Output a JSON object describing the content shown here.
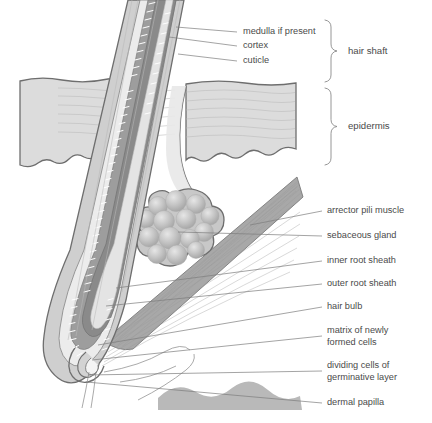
{
  "figure": {
    "background_color": "#ffffff",
    "text_color": "#4a4a4a",
    "leader_color": "#7d7d7d"
  },
  "labels": [
    {
      "id": "medulla",
      "text": "medulla if present",
      "x": 243,
      "y": 32,
      "leader_from_x": 237,
      "leader_from_y": 32,
      "leader_to_x": 176,
      "leader_to_y": 27
    },
    {
      "id": "cortex",
      "text": "cortex",
      "x": 243,
      "y": 46,
      "leader_from_x": 237,
      "leader_from_y": 46,
      "leader_to_x": 169,
      "leader_to_y": 37
    },
    {
      "id": "cuticle",
      "text": "cuticle",
      "x": 243,
      "y": 61,
      "leader_from_x": 237,
      "leader_from_y": 61,
      "leader_to_x": 178,
      "leader_to_y": 54
    },
    {
      "id": "arrector-pili",
      "text": "arrector pili muscle",
      "x": 327,
      "y": 211,
      "leader_from_x": 322,
      "leader_from_y": 211,
      "leader_to_x": 250,
      "leader_to_y": 225
    },
    {
      "id": "sebaceous-gland",
      "text": "sebaceous gland",
      "x": 327,
      "y": 236,
      "leader_from_x": 322,
      "leader_from_y": 236,
      "leader_to_x": 178,
      "leader_to_y": 232
    },
    {
      "id": "inner-root-sheath",
      "text": "inner root sheath",
      "x": 327,
      "y": 261,
      "leader_from_x": 322,
      "leader_from_y": 261,
      "leader_to_x": 116,
      "leader_to_y": 288
    },
    {
      "id": "outer-root-sheath",
      "text": "outer root sheath",
      "x": 327,
      "y": 284,
      "leader_from_x": 322,
      "leader_from_y": 284,
      "leader_to_x": 106,
      "leader_to_y": 306
    },
    {
      "id": "hair-bulb",
      "text": "hair bulb",
      "x": 327,
      "y": 307,
      "leader_from_x": 322,
      "leader_from_y": 307,
      "leader_to_x": 98,
      "leader_to_y": 345
    },
    {
      "id": "matrix",
      "text": "matrix of newly",
      "x": 327,
      "y": 331,
      "leader_from_x": 322,
      "leader_from_y": 336,
      "leader_to_x": 92,
      "leader_to_y": 360
    },
    {
      "id": "matrix-line2",
      "text": "formed cells",
      "x": 327,
      "y": 343,
      "leader_from_x": null,
      "leader_from_y": null,
      "leader_to_x": null,
      "leader_to_y": null
    },
    {
      "id": "dividing-cells",
      "text": "dividing cells of",
      "x": 327,
      "y": 366,
      "leader_from_x": 322,
      "leader_from_y": 371,
      "leader_to_x": 88,
      "leader_to_y": 375
    },
    {
      "id": "dividing-line2",
      "text": "germinative layer",
      "x": 327,
      "y": 378,
      "leader_from_x": null,
      "leader_from_y": null,
      "leader_to_x": null,
      "leader_to_y": null
    },
    {
      "id": "dermal-papilla",
      "text": "dermal papilla",
      "x": 327,
      "y": 403,
      "leader_from_x": 322,
      "leader_from_y": 403,
      "leader_to_x": 86,
      "leader_to_y": 382
    }
  ],
  "groups": [
    {
      "id": "hair-shaft",
      "text": "hair shaft",
      "label_x": 348,
      "label_y": 51,
      "brace_x": 331,
      "brace_top": 20,
      "brace_bottom": 82
    },
    {
      "id": "epidermis",
      "text": "epidermis",
      "label_x": 348,
      "label_y": 126,
      "brace_x": 331,
      "brace_top": 88,
      "brace_bottom": 165
    }
  ],
  "structures": {
    "epidermis_fill": "#dcdcdc",
    "dermis_fill": "#fbfbfb",
    "hair_cortex_fill": "#8a8a8a",
    "hair_medulla_fill": "#e2e2e2",
    "hair_cuticle_fill": "#9f9f9f",
    "outer_sheath_fill": "#c6c6c6",
    "inner_sheath_fill": "#ededed",
    "muscle_fill": "#a8a8a8",
    "gland_fill": "#c0c0c0",
    "papilla_fill": "#b5b5b5",
    "bulb_fill": "#8f8f8f"
  }
}
